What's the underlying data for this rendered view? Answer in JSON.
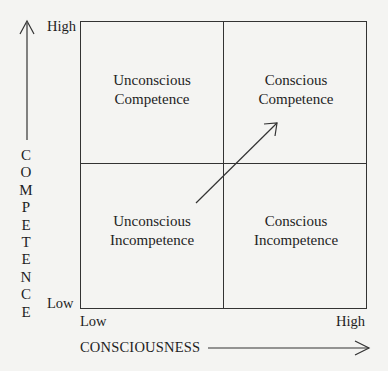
{
  "diagram": {
    "type": "2x2 matrix",
    "y_axis": {
      "title": "COMPETENCE",
      "high_label": "High",
      "low_label": "Low"
    },
    "x_axis": {
      "title": "CONSCIOUSNESS",
      "low_label": "Low",
      "high_label": "High"
    },
    "quadrants": {
      "top_left": {
        "line1": "Unconscious",
        "line2": "Competence"
      },
      "top_right": {
        "line1": "Conscious",
        "line2": "Competence"
      },
      "bottom_left": {
        "line1": "Unconscious",
        "line2": "Incompetence"
      },
      "bottom_right": {
        "line1": "Conscious",
        "line2": "Incompetence"
      }
    },
    "arrow": {
      "from": "Unconscious Incompetence",
      "to": "Conscious Competence"
    },
    "colors": {
      "line": "#333333",
      "text": "#1e1e1e",
      "background": "#f4f4f2"
    }
  }
}
